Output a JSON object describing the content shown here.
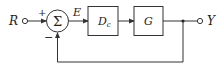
{
  "diagram": {
    "type": "feedback-control-block-diagram",
    "input_label": "R",
    "output_label": "Y",
    "error_label": "E",
    "summing_junction": {
      "symbol": "Σ",
      "plus_sign": "+",
      "minus_sign": "−"
    },
    "blocks": [
      {
        "id": "controller",
        "label": "D",
        "subscript": "c"
      },
      {
        "id": "plant",
        "label": "G"
      }
    ],
    "feedback": "unity negative feedback",
    "colors": {
      "stroke": "#333333",
      "background": "#ffffff"
    }
  }
}
